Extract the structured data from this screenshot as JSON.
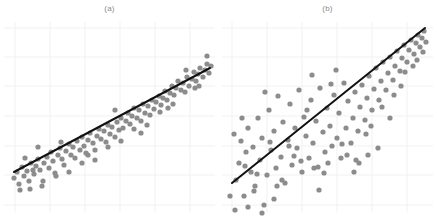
{
  "figure": {
    "background": "#ffffff",
    "width": 437,
    "height": 218
  },
  "style": {
    "point_color": "#8c8c8c",
    "point_radius": 2.6,
    "line_color": "#111111",
    "line_width": 2.0,
    "grid_color": "#f1f1f1",
    "grid_width": 1.0,
    "caption_color": "#8a8a8a"
  },
  "panels": [
    {
      "id": "a",
      "caption": "(a)",
      "caption_x": 110,
      "caption_y": 12
    },
    {
      "id": "b",
      "caption": "(b)",
      "caption_x": 110,
      "caption_y": 12
    }
  ],
  "chart_data": [
    {
      "type": "scatter",
      "id": "panel-a",
      "title": "(a)",
      "xlabel": "",
      "ylabel": "",
      "xlim": [
        0,
        219
      ],
      "ylim": [
        218,
        0
      ],
      "grid": true,
      "grid_x": [
        15,
        50,
        85,
        120,
        155,
        190
      ],
      "grid_y": [
        28,
        57,
        86,
        116,
        146,
        175,
        205
      ],
      "series": [
        {
          "name": "observations",
          "marker": "circle",
          "color": "#8c8c8c",
          "points": [
            [
              14,
              178
            ],
            [
              17,
              172
            ],
            [
              19,
              184
            ],
            [
              22,
              167
            ],
            [
              24,
              176
            ],
            [
              27,
              171
            ],
            [
              29,
              181
            ],
            [
              31,
              163
            ],
            [
              34,
              174
            ],
            [
              36,
              166
            ],
            [
              38,
              159
            ],
            [
              40,
              170
            ],
            [
              42,
              186
            ],
            [
              44,
              163
            ],
            [
              47,
              157
            ],
            [
              49,
              168
            ],
            [
              51,
              152
            ],
            [
              53,
              161
            ],
            [
              55,
              173
            ],
            [
              58,
              155
            ],
            [
              60,
              148
            ],
            [
              62,
              159
            ],
            [
              64,
              165
            ],
            [
              66,
              151
            ],
            [
              69,
              144
            ],
            [
              71,
              155
            ],
            [
              73,
              147
            ],
            [
              75,
              158
            ],
            [
              77,
              141
            ],
            [
              80,
              150
            ],
            [
              82,
              137
            ],
            [
              84,
              146
            ],
            [
              86,
              153
            ],
            [
              88,
              140
            ],
            [
              90,
              133
            ],
            [
              93,
              143
            ],
            [
              95,
              150
            ],
            [
              97,
              136
            ],
            [
              99,
              129
            ],
            [
              101,
              139
            ],
            [
              104,
              131
            ],
            [
              106,
              142
            ],
            [
              108,
              125
            ],
            [
              110,
              134
            ],
            [
              112,
              127
            ],
            [
              115,
              137
            ],
            [
              117,
              122
            ],
            [
              119,
              130
            ],
            [
              121,
              118
            ],
            [
              123,
              128
            ],
            [
              126,
              121
            ],
            [
              128,
              113
            ],
            [
              130,
              124
            ],
            [
              132,
              116
            ],
            [
              134,
              108
            ],
            [
              137,
              118
            ],
            [
              139,
              110
            ],
            [
              141,
              121
            ],
            [
              143,
              104
            ],
            [
              145,
              113
            ],
            [
              148,
              106
            ],
            [
              150,
              115
            ],
            [
              152,
              100
            ],
            [
              154,
              109
            ],
            [
              156,
              102
            ],
            [
              159,
              96
            ],
            [
              161,
              105
            ],
            [
              163,
              98
            ],
            [
              165,
              91
            ],
            [
              167,
              100
            ],
            [
              170,
              93
            ],
            [
              172,
              86
            ],
            [
              174,
              95
            ],
            [
              176,
              88
            ],
            [
              178,
              81
            ],
            [
              181,
              90
            ],
            [
              183,
              83
            ],
            [
              185,
              92
            ],
            [
              187,
              77
            ],
            [
              189,
              86
            ],
            [
              192,
              79
            ],
            [
              194,
              72
            ],
            [
              196,
              81
            ],
            [
              198,
              74
            ],
            [
              200,
              68
            ],
            [
              203,
              77
            ],
            [
              205,
              70
            ],
            [
              207,
              64
            ],
            [
              209,
              73
            ],
            [
              211,
              66
            ],
            [
              33,
              170
            ],
            [
              61,
              142
            ],
            [
              88,
              155
            ],
            [
              115,
              110
            ],
            [
              141,
              133
            ],
            [
              168,
              108
            ],
            [
              195,
              88
            ],
            [
              207,
              56
            ],
            [
              199,
              86
            ],
            [
              186,
              70
            ],
            [
              173,
              104
            ],
            [
              160,
              112
            ],
            [
              147,
              125
            ],
            [
              134,
              129
            ],
            [
              121,
              141
            ],
            [
              108,
              147
            ],
            [
              95,
              160
            ],
            [
              82,
              163
            ],
            [
              69,
              172
            ],
            [
              56,
              176
            ],
            [
              43,
              181
            ],
            [
              30,
              189
            ],
            [
              20,
              190
            ],
            [
              25,
              158
            ],
            [
              38,
              147
            ]
          ]
        }
      ],
      "fit_line": {
        "name": "regression-line",
        "color": "#111111",
        "x1": 14,
        "y1": 172,
        "x2": 210,
        "y2": 68
      }
    },
    {
      "type": "scatter",
      "id": "panel-b",
      "title": "(b)",
      "xlabel": "",
      "ylabel": "",
      "xlim": [
        0,
        219
      ],
      "ylim": [
        218,
        0
      ],
      "grid": true,
      "grid_x": [
        14,
        49,
        84,
        119,
        154,
        189
      ],
      "grid_y": [
        28,
        57,
        86,
        116,
        146,
        175,
        205
      ],
      "series": [
        {
          "name": "observations",
          "marker": "circle",
          "color": "#8c8c8c",
          "points": [
            [
              12,
              196
            ],
            [
              16,
              134
            ],
            [
              18,
              180
            ],
            [
              21,
              163
            ],
            [
              23,
              141
            ],
            [
              26,
              196
            ],
            [
              28,
              152
            ],
            [
              30,
              128
            ],
            [
              33,
              172
            ],
            [
              35,
              147
            ],
            [
              37,
              186
            ],
            [
              40,
              118
            ],
            [
              42,
              160
            ],
            [
              44,
              138
            ],
            [
              46,
              205
            ],
            [
              49,
              175
            ],
            [
              51,
              110
            ],
            [
              53,
              150
            ],
            [
              56,
              131
            ],
            [
              58,
              168
            ],
            [
              60,
              96
            ],
            [
              63,
              157
            ],
            [
              65,
              122
            ],
            [
              67,
              183
            ],
            [
              70,
              140
            ],
            [
              72,
              104
            ],
            [
              74,
              165
            ],
            [
              77,
              128
            ],
            [
              79,
              148
            ],
            [
              81,
              90
            ],
            [
              84,
              172
            ],
            [
              86,
              117
            ],
            [
              88,
              136
            ],
            [
              91,
              158
            ],
            [
              93,
              100
            ],
            [
              95,
              143
            ],
            [
              98,
              121
            ],
            [
              100,
              167
            ],
            [
              102,
              88
            ],
            [
              105,
              132
            ],
            [
              107,
              152
            ],
            [
              109,
              108
            ],
            [
              112,
              126
            ],
            [
              114,
              146
            ],
            [
              116,
              95
            ],
            [
              119,
              138
            ],
            [
              121,
              113
            ],
            [
              123,
              158
            ],
            [
              126,
              83
            ],
            [
              128,
              128
            ],
            [
              130,
              101
            ],
            [
              133,
              143
            ],
            [
              135,
              118
            ],
            [
              137,
              92
            ],
            [
              140,
              131
            ],
            [
              142,
              107
            ],
            [
              144,
              85
            ],
            [
              147,
              120
            ],
            [
              149,
              98
            ],
            [
              151,
              76
            ],
            [
              154,
              110
            ],
            [
              156,
              89
            ],
            [
              158,
              68
            ],
            [
              161,
              100
            ],
            [
              163,
              81
            ],
            [
              165,
              62
            ],
            [
              168,
              90
            ],
            [
              170,
              73
            ],
            [
              172,
              57
            ],
            [
              175,
              80
            ],
            [
              177,
              66
            ],
            [
              179,
              51
            ],
            [
              182,
              71
            ],
            [
              184,
              58
            ],
            [
              186,
              45
            ],
            [
              189,
              62
            ],
            [
              191,
              50
            ],
            [
              193,
              40
            ],
            [
              196,
              54
            ],
            [
              198,
              43
            ],
            [
              200,
              35
            ],
            [
              202,
              47
            ],
            [
              204,
              38
            ],
            [
              206,
              31
            ],
            [
              208,
              42
            ],
            [
              24,
              118
            ],
            [
              36,
              191
            ],
            [
              47,
              92
            ],
            [
              59,
              186
            ],
            [
              71,
              146
            ],
            [
              83,
              161
            ],
            [
              94,
              75
            ],
            [
              106,
              173
            ],
            [
              118,
              70
            ],
            [
              129,
              155
            ],
            [
              141,
              163
            ],
            [
              153,
              126
            ],
            [
              164,
              107
            ],
            [
              176,
              95
            ],
            [
              187,
              72
            ],
            [
              199,
              60
            ],
            [
              17,
              210
            ],
            [
              30,
              207
            ],
            [
              44,
              213
            ],
            [
              56,
              199
            ],
            [
              27,
              166
            ],
            [
              39,
              174
            ],
            [
              52,
              142
            ],
            [
              64,
              180
            ],
            [
              76,
              156
            ],
            [
              89,
              110
            ],
            [
              101,
              190
            ],
            [
              113,
              84
            ],
            [
              124,
              144
            ],
            [
              136,
              172
            ],
            [
              148,
              134
            ],
            [
              160,
              148
            ],
            [
              172,
              118
            ],
            [
              183,
              86
            ],
            [
              195,
              66
            ],
            [
              205,
              52
            ],
            [
              150,
              155
            ],
            [
              138,
              160
            ],
            [
              110,
              163
            ],
            [
              96,
              168
            ]
          ]
        }
      ],
      "fit_line": {
        "name": "regression-line",
        "color": "#111111",
        "x1": 14,
        "y1": 183,
        "x2": 207,
        "y2": 28
      }
    }
  ]
}
